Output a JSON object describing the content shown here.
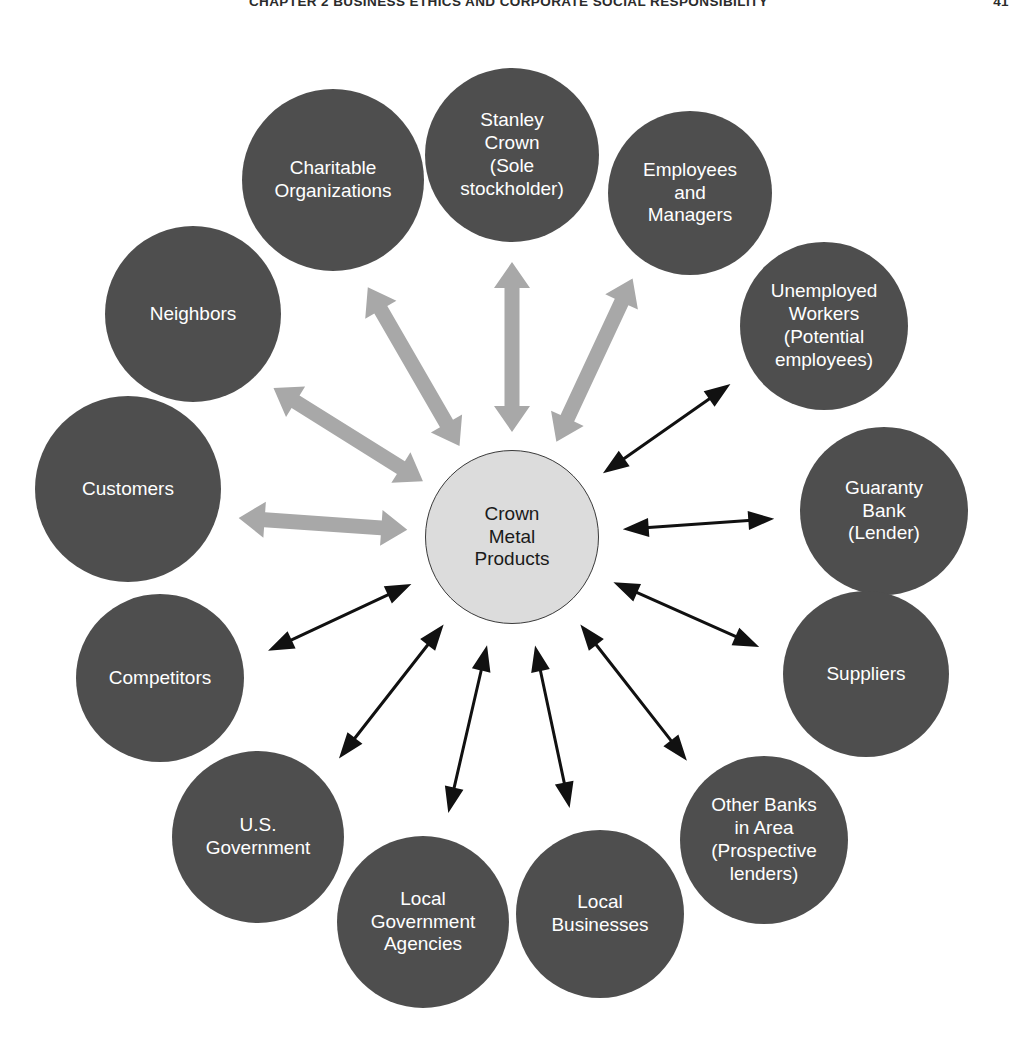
{
  "running_head": {
    "text": "CHAPTER 2    BUSINESS ETHICS AND CORPORATE SOCIAL RESPONSIBILITY",
    "page_number": "41"
  },
  "colors": {
    "outer_node_fill": "#4e4e4e",
    "outer_node_text": "#ffffff",
    "center_node_fill": "#dcdcdc",
    "center_node_text": "#1a1a1a",
    "center_node_stroke": "#3a3a3a",
    "thick_arrow": "#a8a8a8",
    "thin_arrow": "#111111",
    "page_background": "#ffffff"
  },
  "chart_data": {
    "type": "diagram",
    "center": {
      "id": "crown-metal-products",
      "label": "Crown\nMetal\nProducts",
      "cx": 512,
      "cy": 537,
      "r": 87
    },
    "nodes": [
      {
        "id": "stanley-crown",
        "label": "Stanley\nCrown\n(Sole\nstockholder)",
        "cx": 512,
        "cy": 155,
        "r": 87,
        "angle_deg": 270,
        "arrow": "thick"
      },
      {
        "id": "employees-and-managers",
        "label": "Employees\nand\nManagers",
        "cx": 690,
        "cy": 193,
        "r": 82,
        "angle_deg": 295,
        "arrow": "thick"
      },
      {
        "id": "unemployed-workers",
        "label": "Unemployed\nWorkers\n(Potential\nemployees)",
        "cx": 824,
        "cy": 326,
        "r": 84,
        "angle_deg": 325,
        "arrow": "thin"
      },
      {
        "id": "guaranty-bank",
        "label": "Guaranty\nBank\n(Lender)",
        "cx": 884,
        "cy": 511,
        "r": 84,
        "angle_deg": 356,
        "arrow": "thin"
      },
      {
        "id": "suppliers",
        "label": "Suppliers",
        "cx": 866,
        "cy": 674,
        "r": 83,
        "angle_deg": 24,
        "arrow": "thin"
      },
      {
        "id": "other-banks-in-area",
        "label": "Other Banks\nin Area\n(Prospective\nlenders)",
        "cx": 764,
        "cy": 840,
        "r": 84,
        "angle_deg": 52,
        "arrow": "thin"
      },
      {
        "id": "local-businesses",
        "label": "Local\nBusinesses",
        "cx": 600,
        "cy": 914,
        "r": 84,
        "angle_deg": 78,
        "arrow": "thin"
      },
      {
        "id": "local-government-agencies",
        "label": "Local\nGovernment\nAgencies",
        "cx": 423,
        "cy": 922,
        "r": 86,
        "angle_deg": 103,
        "arrow": "thin"
      },
      {
        "id": "us-government",
        "label": "U.S.\nGovernment",
        "cx": 258,
        "cy": 837,
        "r": 86,
        "angle_deg": 128,
        "arrow": "thin"
      },
      {
        "id": "competitors",
        "label": "Competitors",
        "cx": 160,
        "cy": 678,
        "r": 84,
        "angle_deg": 155,
        "arrow": "thin"
      },
      {
        "id": "customers",
        "label": "Customers",
        "cx": 128,
        "cy": 489,
        "r": 93,
        "angle_deg": 184,
        "arrow": "thick"
      },
      {
        "id": "neighbors",
        "label": "Neighbors",
        "cx": 193,
        "cy": 314,
        "r": 88,
        "angle_deg": 212,
        "arrow": "thick"
      },
      {
        "id": "charitable-organizations",
        "label": "Charitable\nOrganizations",
        "cx": 333,
        "cy": 180,
        "r": 91,
        "angle_deg": 240,
        "arrow": "thick"
      }
    ],
    "arrow_styles": {
      "thick": {
        "color": "#a8a8a8",
        "shaft_width": 15,
        "head_width": 36,
        "head_length": 26,
        "double_headed": true
      },
      "thin": {
        "color": "#111111",
        "shaft_width": 3,
        "head_width": 19,
        "head_length": 26,
        "double_headed": true
      }
    }
  }
}
